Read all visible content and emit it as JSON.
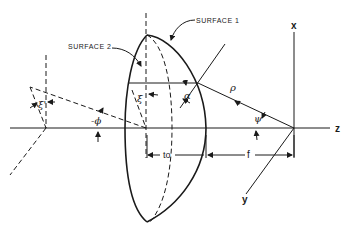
{
  "diagram": {
    "type": "lens geometry diagram",
    "labels": {
      "surface1": "SURFACE  1",
      "surface2": "SURFACE  2",
      "axis_x": "x",
      "axis_y": "y",
      "axis_z": "z",
      "rho": "ρ",
      "psi": "ψ",
      "alpha": "α",
      "xi": "ξ",
      "xi_prime": "ξ'",
      "phi": "-ϕ",
      "thickness": "to",
      "focal_length": "f"
    },
    "colors": {
      "line": "#1a1a1a",
      "background": "#ffffff"
    }
  }
}
